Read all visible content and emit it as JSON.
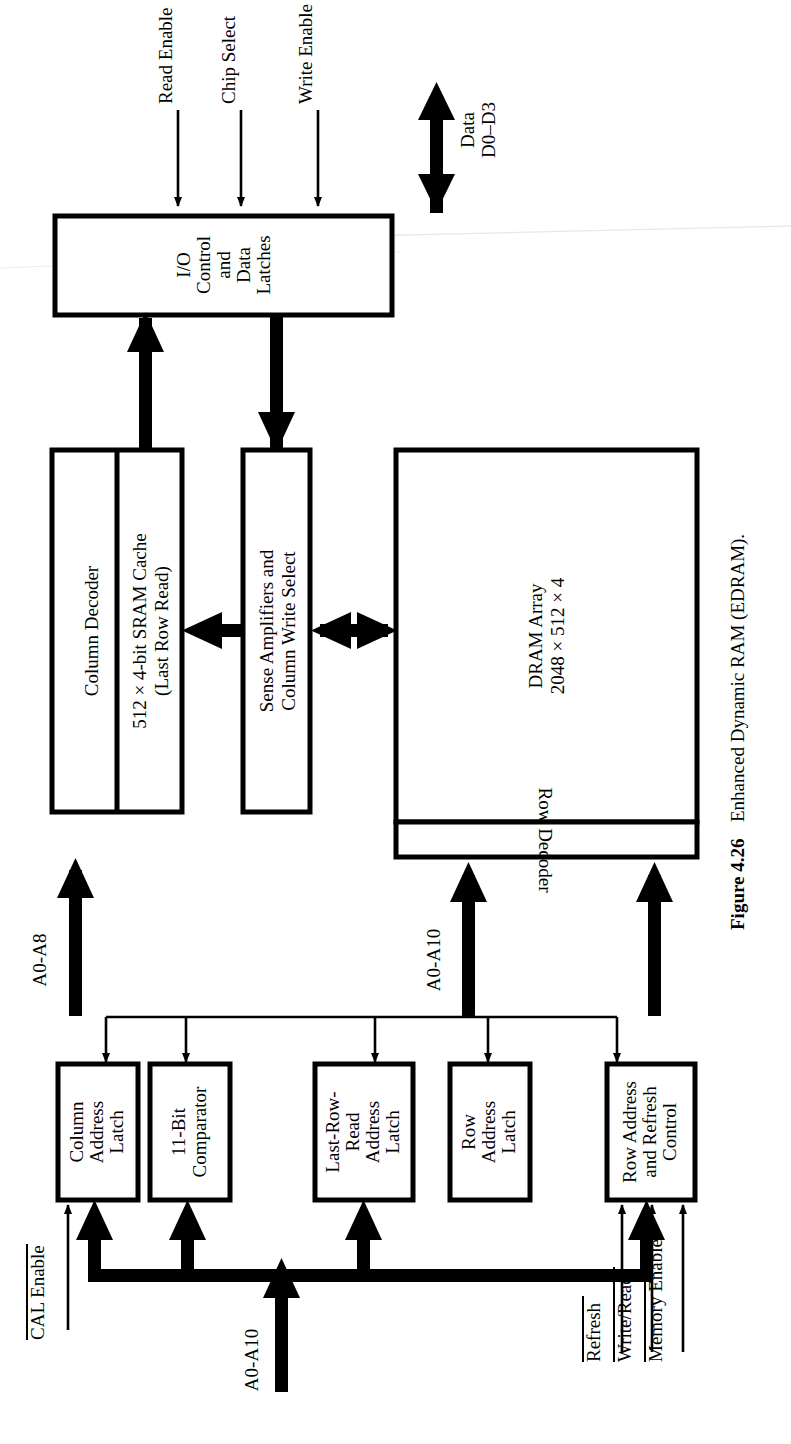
{
  "figure": {
    "number": "Figure 4.26",
    "caption": "Enhanced Dynamic RAM (EDRAM).",
    "orientation": "rotated-90-ccw"
  },
  "blocks": {
    "io_control": {
      "lines": [
        "I/O",
        "Control",
        "and",
        "Data",
        "Latches"
      ]
    },
    "column_decoder": {
      "lines": [
        "Column Decoder"
      ]
    },
    "sram_cache": {
      "lines": [
        "512 × 4-bit SRAM Cache",
        "(Last Row Read)"
      ]
    },
    "sense_amplifiers": {
      "lines": [
        "Sense Amplifiers and",
        "Column Write Select"
      ]
    },
    "dram_array": {
      "lines": [
        "DRAM Array",
        "2048 × 512 × 4"
      ]
    },
    "row_decoder": {
      "lines": [
        "Row Decoder"
      ]
    },
    "column_address_latch": {
      "lines": [
        "Column",
        "Address",
        "Latch"
      ]
    },
    "comparator": {
      "lines": [
        "11-Bit",
        "Comparator"
      ]
    },
    "last_row_read_address_latch": {
      "lines": [
        "Last-Row-",
        "Read",
        "Address",
        "Latch"
      ]
    },
    "row_address_latch": {
      "lines": [
        "Row",
        "Address",
        "Latch"
      ]
    },
    "row_address_refresh_control": {
      "lines": [
        "Row Address",
        "and Refresh",
        "Control"
      ]
    }
  },
  "signals": {
    "read_enable": {
      "label": "Read Enable",
      "overbar": false
    },
    "chip_select": {
      "label": "Chip Select",
      "overbar": false
    },
    "write_enable": {
      "label": "Write Enable",
      "overbar": false
    },
    "data_bus": {
      "lines": [
        "Data",
        "D0–D3"
      ],
      "overbar": false
    },
    "cal_enable": {
      "label": "CAL Enable",
      "overbar": true
    },
    "addr_a0_a10_bottom": {
      "label": "A0-A10",
      "overbar": false
    },
    "addr_a0_a8": {
      "label": "A0-A8",
      "overbar": false
    },
    "addr_a0_a10_row": {
      "label": "A0-A10",
      "overbar": false
    },
    "refresh": {
      "label": "Refresh",
      "overbar": true
    },
    "write_read": {
      "label": "Write/Read",
      "overbar": true
    },
    "memory_enable": {
      "label": "Memory Enable",
      "overbar": true
    }
  },
  "colors": {
    "ink": "#000000",
    "paper": "#ffffff"
  }
}
